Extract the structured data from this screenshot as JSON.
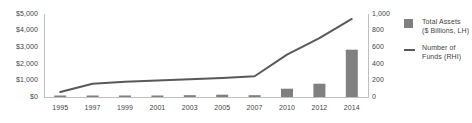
{
  "chart_data": {
    "type": "bar",
    "title": "",
    "xlabel": "",
    "categories": [
      "1995",
      "1997",
      "1999",
      "2001",
      "2003",
      "2005",
      "2007",
      "2010",
      "2012",
      "2014"
    ],
    "grid": false,
    "legend_position": "right",
    "series": [
      {
        "name": "Total Assets ($ Billions, LH)",
        "type": "bar",
        "axis": "left",
        "color": "#808080",
        "values": [
          30,
          60,
          90,
          70,
          110,
          140,
          110,
          500,
          800,
          2850
        ]
      },
      {
        "name": "Number of Funds (RHI)",
        "type": "line",
        "axis": "right",
        "color": "#595959",
        "values": [
          60,
          160,
          185,
          200,
          215,
          230,
          250,
          510,
          710,
          940
        ]
      }
    ],
    "left_axis": {
      "label": "",
      "ylim": [
        0,
        5000
      ],
      "ticks": [
        0,
        1000,
        2000,
        3000,
        4000,
        5000
      ],
      "tick_labels": [
        "$0",
        "$1,000",
        "$2,000",
        "$3,000",
        "$4,000",
        "$5,000"
      ]
    },
    "right_axis": {
      "label": "",
      "ylim": [
        0,
        1000
      ],
      "ticks": [
        0,
        200,
        400,
        600,
        800,
        1000
      ],
      "tick_labels": [
        "0",
        "200",
        "400",
        "600",
        "800",
        "1,000"
      ]
    }
  },
  "legend": {
    "items": [
      {
        "marker": "bar-swatch",
        "line1": "Total Assets",
        "line2": "($ Billions, LH)"
      },
      {
        "marker": "line-swatch",
        "line1": "Number of",
        "line2": "Funds (RHI)"
      }
    ]
  }
}
